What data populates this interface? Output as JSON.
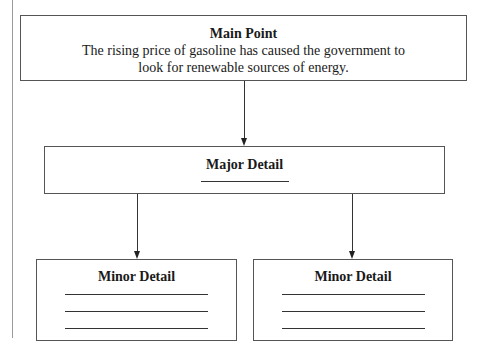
{
  "diagram": {
    "type": "hierarchy-organizer",
    "main_point": {
      "title": "Main Point",
      "text_line1": "The rising price of gasoline has caused the government to",
      "text_line2": "look for renewable sources of energy."
    },
    "major_detail": {
      "title": "Major Detail",
      "blank_lines": 1
    },
    "minor_details": [
      {
        "title": "Minor Detail",
        "blank_lines": 3
      },
      {
        "title": "Minor Detail",
        "blank_lines": 3
      }
    ],
    "edges": [
      {
        "from": "main_point",
        "to": "major_detail"
      },
      {
        "from": "major_detail",
        "to": "minor_details.0"
      },
      {
        "from": "major_detail",
        "to": "minor_details.1"
      }
    ]
  }
}
